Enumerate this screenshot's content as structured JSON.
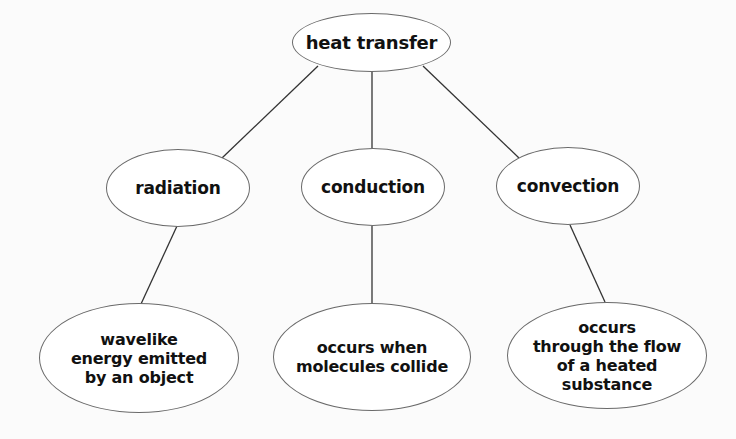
{
  "diagram": {
    "type": "concept-map",
    "root": {
      "label": "heat transfer"
    },
    "branches": [
      {
        "label": "radiation",
        "detail": "wavelike\nenergy emitted\nby an object"
      },
      {
        "label": "conduction",
        "detail": "occurs when\nmolecules collide"
      },
      {
        "label": "convection",
        "detail": "occurs\nthrough the flow\nof a heated\nsubstance"
      }
    ]
  },
  "colors": {
    "background": "#fbfbfb",
    "stroke": "#6a6a6a",
    "line": "#333333",
    "text": "#111111"
  }
}
